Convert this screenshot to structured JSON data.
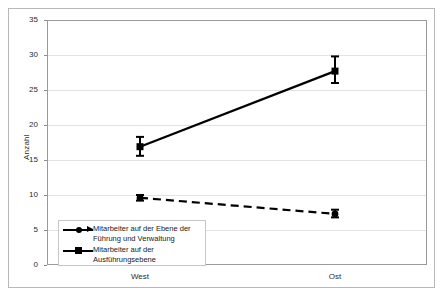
{
  "chart_data": {
    "type": "line",
    "title": "",
    "subtitle": "",
    "xlabel": "",
    "ylabel": "Anzahl",
    "categories": [
      "West",
      "Ost"
    ],
    "ylim": [
      0,
      35
    ],
    "yticks": [
      0,
      5,
      10,
      15,
      20,
      25,
      30,
      35
    ],
    "ytick_labels": [
      "0",
      "5",
      "10",
      "15",
      "20",
      "25",
      "30",
      "35"
    ],
    "grid": true,
    "legend_position": "inside lower-left",
    "error_bars": true,
    "series": [
      {
        "name": "Mitarbeiter auf der Ebene der Führung und Verwaltung",
        "legend_label_line1": "Mitarbeiter auf der Ebene der",
        "legend_label_line2": "Führung und Verwaltung",
        "linestyle": "dashed",
        "marker": "circle",
        "color": "#000000",
        "values": [
          9.6,
          7.3
        ],
        "err_low": [
          9.2,
          6.8
        ],
        "err_high": [
          10.0,
          7.9
        ]
      },
      {
        "name": "Mitarbeiter auf der Ausführungsebene",
        "legend_label_line1": "Mitarbeiter auf der",
        "legend_label_line2": "Ausführungsebene",
        "linestyle": "solid",
        "marker": "square",
        "color": "#000000",
        "values": [
          16.9,
          27.7
        ],
        "err_low": [
          15.6,
          26.0
        ],
        "err_high": [
          18.3,
          29.8
        ]
      }
    ]
  },
  "axes": {
    "y_title": "Anzahl"
  }
}
